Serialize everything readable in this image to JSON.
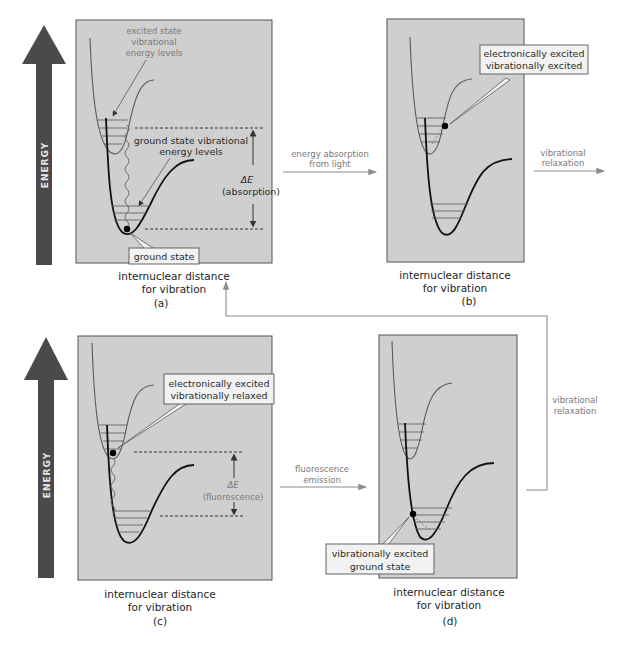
{
  "figure": {
    "energy_axis_label": "ENERGY",
    "x_axis_label_line1": "internuclear distance",
    "x_axis_label_line2": "for vibration",
    "colors": {
      "panel_fill": "#cfcfcf",
      "energy_arrow": "#4a4a4a",
      "flow_arrow": "#8c8c8c",
      "callout_fill": "#f2f2f2"
    }
  },
  "panels": {
    "a": {
      "tag": "(a)",
      "excited_levels_label": [
        "excited state",
        "vibrational",
        "energy levels"
      ],
      "ground_levels_label": [
        "ground state vibrational",
        "energy levels"
      ],
      "delta_e_symbol": "ΔE",
      "delta_e_label": "(absorption)",
      "callout": "ground state"
    },
    "b": {
      "tag": "(b)",
      "callout": [
        "electronically excited",
        "vibrationally excited"
      ]
    },
    "c": {
      "tag": "(c)",
      "callout": [
        "electronically excited",
        "vibrationally relaxed"
      ],
      "delta_e_symbol": "ΔE",
      "delta_e_label": "(fluorescence)"
    },
    "d": {
      "tag": "(d)",
      "callout": [
        "vibrationally excited",
        "ground state"
      ]
    }
  },
  "transitions": {
    "a_to_b": [
      "energy absorption",
      "from light"
    ],
    "b_out": [
      "vibrational",
      "relaxation"
    ],
    "d_to_a": [
      "vibrational",
      "relaxation"
    ],
    "c_to_d": [
      "fluorescence",
      "emission"
    ]
  }
}
